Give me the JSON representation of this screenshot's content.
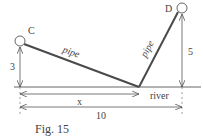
{
  "figure": {
    "caption": "Fig. 15",
    "points": {
      "C": "C",
      "D": "D"
    },
    "labels": {
      "pipe_left": "pipe",
      "pipe_right": "pipe",
      "height_C": "3",
      "height_D": "5",
      "distance_x": "x",
      "distance_total": "10",
      "river": "river"
    },
    "colors": {
      "pipe": "#4a4a4a",
      "lines": "#555555",
      "text": "#444444"
    }
  }
}
